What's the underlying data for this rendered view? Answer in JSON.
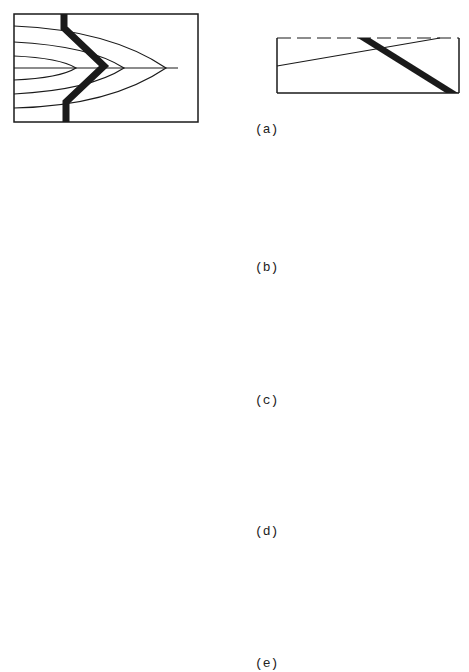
{
  "figure": {
    "panels": [
      {
        "id": "a",
        "label": "(a)",
        "description": "map view: bed bent into chevron across fold; section view: dipping bed crossing layers"
      },
      {
        "id": "b",
        "label": "(b)",
        "description": "map view: vertical straight bed; section view: vertical bed"
      },
      {
        "id": "c",
        "label": "(c)",
        "description": "map view: bed bent with reverse chevron; section view: bed dipping opposite direction"
      },
      {
        "id": "d",
        "label": "(d)",
        "description": "map view: thick bed following contours partly; section view: bed near-parallel to top"
      },
      {
        "id": "e",
        "label": "(e)",
        "description": "map view: thick bed forming closed V around contours; section view: bed parallel to layering"
      }
    ]
  },
  "colors": {
    "ink": "#1a1a1a",
    "background": "#ffffff"
  }
}
